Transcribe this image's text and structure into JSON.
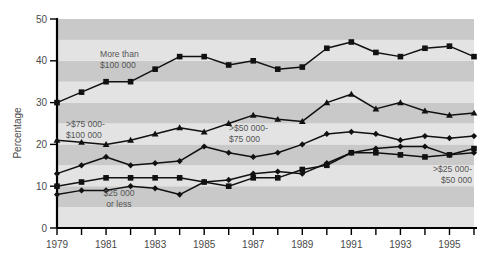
{
  "chart_data": {
    "type": "line",
    "title": "",
    "subtitle": "",
    "xlabel": "",
    "ylabel": "Percentage",
    "xlim": [
      1979,
      1996
    ],
    "ylim": [
      0,
      50
    ],
    "yticks": [
      0,
      10,
      20,
      30,
      40,
      50
    ],
    "ytick_labels": [
      "0",
      "10",
      "20",
      "30",
      "40",
      "50"
    ],
    "xticks": [
      1979,
      1980,
      1981,
      1982,
      1983,
      1984,
      1985,
      1986,
      1987,
      1988,
      1989,
      1990,
      1991,
      1992,
      1993,
      1994,
      1995,
      1996
    ],
    "xtick_labels": [
      "1979",
      "",
      "1981",
      "",
      "1983",
      "",
      "1985",
      "",
      "1987",
      "",
      "1989",
      "",
      "1991",
      "",
      "1993",
      "",
      "1995",
      ""
    ],
    "grid": false,
    "banded_background": true,
    "band_colors": [
      "#e3e3e3",
      "#c9c9c9"
    ],
    "band_step": 5,
    "legend_position": "inline-annotations",
    "line_color": "#111111",
    "x": [
      1979,
      1980,
      1981,
      1982,
      1983,
      1984,
      1985,
      1986,
      1987,
      1988,
      1989,
      1990,
      1991,
      1992,
      1993,
      1994,
      1995,
      1996
    ],
    "series": [
      {
        "name": "More than $100 000",
        "marker": "square",
        "values": [
          30,
          32.5,
          35,
          35,
          38,
          41,
          41,
          39,
          40,
          38,
          38.5,
          43,
          44.5,
          42,
          41,
          43,
          43.5,
          41
        ]
      },
      {
        "name": ">$75 000-$100 000",
        "marker": "triangle",
        "values": [
          21,
          20.5,
          20,
          21,
          22.5,
          24,
          23,
          25,
          27,
          26,
          25.5,
          30,
          32,
          28.5,
          30,
          28,
          27,
          27.5
        ]
      },
      {
        "name": ">$50 000-$75 000",
        "marker": "diamond",
        "values": [
          13,
          15,
          17,
          15,
          15.5,
          16,
          19.5,
          18,
          17,
          18,
          20,
          22.5,
          23,
          22.5,
          21,
          22,
          21.5,
          22
        ]
      },
      {
        "name": ">$25 000-$50 000",
        "marker": "square",
        "values": [
          10,
          11,
          12,
          12,
          12,
          12,
          11,
          10,
          12,
          12,
          14,
          15,
          18,
          18,
          17.5,
          17,
          17.5,
          19
        ]
      },
      {
        "name": "$25 000 or less",
        "marker": "diamond",
        "values": [
          8,
          9,
          9,
          10,
          9.5,
          8,
          11,
          11.5,
          13,
          13.5,
          13,
          15.5,
          18,
          19,
          19.5,
          19.5,
          17.5,
          18
        ]
      }
    ],
    "annotations": [
      {
        "id": "ann-more-than-100000",
        "line1": "More than",
        "line2": "$100 000"
      },
      {
        "id": "ann-75000-100000",
        "line1": ">$75 000-",
        "line2": "$100 000"
      },
      {
        "id": "ann-50000-75000",
        "line1": ">$50 000-",
        "line2": "$75 000"
      },
      {
        "id": "ann-25000-50000",
        "line1": ">$25 000-",
        "line2": "$50 000"
      },
      {
        "id": "ann-25000-or-less",
        "line1": "$25 000",
        "line2": "or less"
      }
    ]
  }
}
